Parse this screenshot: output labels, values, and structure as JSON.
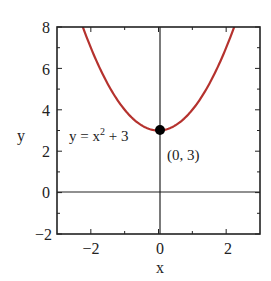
{
  "chart_data": {
    "type": "line",
    "title": "",
    "xlabel": "x",
    "ylabel": "y",
    "xlim": [
      -3,
      3
    ],
    "ylim": [
      -2,
      8
    ],
    "xticks": [
      -2,
      0,
      2
    ],
    "yticks": [
      -2,
      0,
      2,
      4,
      6,
      8
    ],
    "xtick_labels": [
      "−2",
      "0",
      "2"
    ],
    "ytick_labels": [
      "−2",
      "0",
      "2",
      "4",
      "6",
      "8"
    ],
    "grid": false,
    "series": [
      {
        "name": "y = x² + 3",
        "function": "x^2 + 3",
        "color": "#b5322e",
        "x": [
          -2.236,
          -2,
          -1.5,
          -1,
          -0.5,
          0,
          0.5,
          1,
          1.5,
          2,
          2.236
        ],
        "y": [
          8,
          7,
          5.25,
          4,
          3.25,
          3,
          3.25,
          4,
          5.25,
          7,
          8
        ]
      }
    ],
    "points": [
      {
        "x": 0,
        "y": 3,
        "label": "(0, 3)",
        "color": "#000000"
      }
    ],
    "annotations": [
      {
        "text": "y = x² + 3",
        "x": -1.9,
        "y": 2.7
      },
      {
        "text": "(0, 3)",
        "x": 0.2,
        "y": 1.9
      }
    ],
    "reference_lines": [
      {
        "axis": "x",
        "value": 0
      },
      {
        "axis": "y",
        "value": 0
      }
    ]
  },
  "labels": {
    "x_axis": "x",
    "y_axis": "y",
    "curve_eq_main": "y = x",
    "curve_eq_exp": "2",
    "curve_eq_tail": " + 3",
    "point_label": "(0, 3)",
    "xtick_m2": "−2",
    "xtick_0": "0",
    "xtick_2": "2",
    "ytick_m2": "−2",
    "ytick_0": "0",
    "ytick_2": "2",
    "ytick_4": "4",
    "ytick_6": "6",
    "ytick_8": "8"
  },
  "colors": {
    "curve": "#b5322e",
    "axes": "#222222",
    "point": "#000000"
  }
}
